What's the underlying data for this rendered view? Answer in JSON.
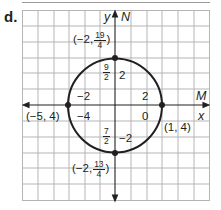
{
  "part_label": "d.",
  "colors": {
    "grid": "#b5b5b5",
    "axis": "#231f20",
    "circle": "#231f20",
    "text": "#231f20"
  },
  "axes": {
    "vertical": {
      "labels": [
        "y",
        "N"
      ]
    },
    "horizontal": {
      "labels": [
        "M",
        "x"
      ]
    }
  },
  "circle": {
    "center_label": "(-2, 4)",
    "radius": "3/4 ... see points",
    "points": [
      {
        "name": "top",
        "prefix": "(−2, ",
        "num": "19",
        "den": "4",
        "suffix": ")"
      },
      {
        "name": "bottom",
        "prefix": "(−2, ",
        "num": "13",
        "den": "4",
        "suffix": ")"
      },
      {
        "name": "left",
        "text": "(−5, 4)"
      },
      {
        "name": "right",
        "text": "(1, 4)"
      }
    ]
  },
  "tick_labels": {
    "n_axis_top_frac": {
      "num": "9",
      "den": "2"
    },
    "n_axis_bottom_frac": {
      "num": "7",
      "den": "2"
    },
    "y_top": "2",
    "y_bottom": "−2",
    "m_left_upper": "−2",
    "x_left_lower": "−4",
    "m_right_upper": "2",
    "x_right_lower": "0"
  }
}
